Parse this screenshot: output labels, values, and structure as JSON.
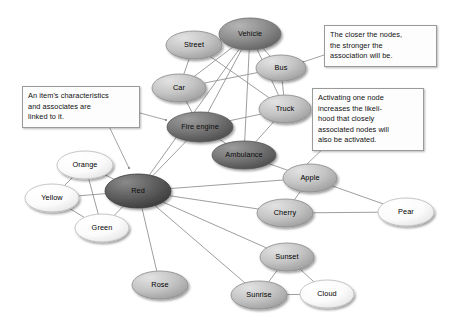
{
  "diagram": {
    "background": "#ffffff",
    "edge_color": "#8d8d8d",
    "nodes": [
      {
        "id": "street",
        "label": "Street",
        "x": 194,
        "y": 45,
        "rx": 28,
        "ry": 14,
        "shade": "mid"
      },
      {
        "id": "vehicle",
        "label": "Vehicle",
        "x": 250,
        "y": 34,
        "rx": 31,
        "ry": 16,
        "shade": "dark"
      },
      {
        "id": "bus",
        "label": "Bus",
        "x": 281,
        "y": 68,
        "rx": 25,
        "ry": 13,
        "shade": "mid"
      },
      {
        "id": "car",
        "label": "Car",
        "x": 179,
        "y": 88,
        "rx": 27,
        "ry": 14,
        "shade": "mid"
      },
      {
        "id": "truck",
        "label": "Truck",
        "x": 285,
        "y": 109,
        "rx": 26,
        "ry": 14,
        "shade": "mid"
      },
      {
        "id": "fireengine",
        "label": "Fire engine",
        "x": 200,
        "y": 127,
        "rx": 33,
        "ry": 15,
        "shade": "darker"
      },
      {
        "id": "ambulance",
        "label": "Ambulance",
        "x": 244,
        "y": 155,
        "rx": 32,
        "ry": 14,
        "shade": "darker"
      },
      {
        "id": "apple",
        "label": "Apple",
        "x": 310,
        "y": 178,
        "rx": 27,
        "ry": 14,
        "shade": "mid"
      },
      {
        "id": "orange",
        "label": "Orange",
        "x": 85,
        "y": 165,
        "rx": 28,
        "ry": 14,
        "shade": "light"
      },
      {
        "id": "yellow",
        "label": "Yellow",
        "x": 52,
        "y": 198,
        "rx": 27,
        "ry": 14,
        "shade": "light"
      },
      {
        "id": "red",
        "label": "Red",
        "x": 138,
        "y": 191,
        "rx": 33,
        "ry": 17,
        "shade": "darkest"
      },
      {
        "id": "green",
        "label": "Green",
        "x": 102,
        "y": 228,
        "rx": 27,
        "ry": 14,
        "shade": "light"
      },
      {
        "id": "cherry",
        "label": "Cherry",
        "x": 285,
        "y": 213,
        "rx": 28,
        "ry": 14,
        "shade": "mid"
      },
      {
        "id": "pear",
        "label": "Pear",
        "x": 406,
        "y": 212,
        "rx": 28,
        "ry": 14,
        "shade": "light"
      },
      {
        "id": "sunset",
        "label": "Sunset",
        "x": 287,
        "y": 257,
        "rx": 27,
        "ry": 14,
        "shade": "mid"
      },
      {
        "id": "rose",
        "label": "Rose",
        "x": 160,
        "y": 285,
        "rx": 28,
        "ry": 14,
        "shade": "mid"
      },
      {
        "id": "sunrise",
        "label": "Sunrise",
        "x": 259,
        "y": 295,
        "rx": 28,
        "ry": 14,
        "shade": "mid"
      },
      {
        "id": "cloud",
        "label": "Cloud",
        "x": 327,
        "y": 294,
        "rx": 27,
        "ry": 14,
        "shade": "light"
      }
    ],
    "edges": [
      [
        "street",
        "vehicle"
      ],
      [
        "street",
        "car"
      ],
      [
        "street",
        "truck"
      ],
      [
        "vehicle",
        "bus"
      ],
      [
        "vehicle",
        "car"
      ],
      [
        "vehicle",
        "truck"
      ],
      [
        "vehicle",
        "fireengine"
      ],
      [
        "vehicle",
        "ambulance"
      ],
      [
        "vehicle",
        "red"
      ],
      [
        "bus",
        "truck"
      ],
      [
        "bus",
        "car"
      ],
      [
        "car",
        "fireengine"
      ],
      [
        "truck",
        "fireengine"
      ],
      [
        "truck",
        "ambulance"
      ],
      [
        "fireengine",
        "ambulance"
      ],
      [
        "fireengine",
        "red"
      ],
      [
        "ambulance",
        "apple"
      ],
      [
        "red",
        "orange"
      ],
      [
        "red",
        "yellow"
      ],
      [
        "red",
        "green"
      ],
      [
        "red",
        "rose"
      ],
      [
        "red",
        "apple"
      ],
      [
        "red",
        "cherry"
      ],
      [
        "red",
        "sunset"
      ],
      [
        "red",
        "sunrise"
      ],
      [
        "orange",
        "yellow"
      ],
      [
        "orange",
        "green"
      ],
      [
        "yellow",
        "green"
      ],
      [
        "apple",
        "cherry"
      ],
      [
        "apple",
        "pear"
      ],
      [
        "cherry",
        "pear"
      ],
      [
        "sunset",
        "sunrise"
      ],
      [
        "sunset",
        "cloud"
      ],
      [
        "sunrise",
        "cloud"
      ]
    ],
    "callouts": [
      {
        "id": "item-characteristics",
        "text": "An item's characteristics\nand associates are\nlinked to it.",
        "x": 22,
        "y": 86,
        "w": 118,
        "h": 34,
        "leaders": [
          {
            "x1": 140,
            "y1": 113,
            "x2": 166,
            "y2": 120
          },
          {
            "x1": 106,
            "y1": 120,
            "x2": 129,
            "y2": 168
          }
        ]
      },
      {
        "id": "closer-nodes",
        "text": "The closer the nodes,\nthe stronger the\nassociation will be.",
        "x": 324,
        "y": 25,
        "w": 113,
        "h": 34,
        "leaders": [
          {
            "x1": 324,
            "y1": 55,
            "x2": 303,
            "y2": 62
          }
        ]
      },
      {
        "id": "activating-node",
        "text": "Activating one node\nincreases the likeli-\nhood that closely\nassociated nodes will\nalso be activated.",
        "x": 312,
        "y": 88,
        "w": 112,
        "h": 52,
        "leaders": [
          {
            "x1": 332,
            "y1": 140,
            "x2": 305,
            "y2": 166
          }
        ]
      }
    ]
  }
}
